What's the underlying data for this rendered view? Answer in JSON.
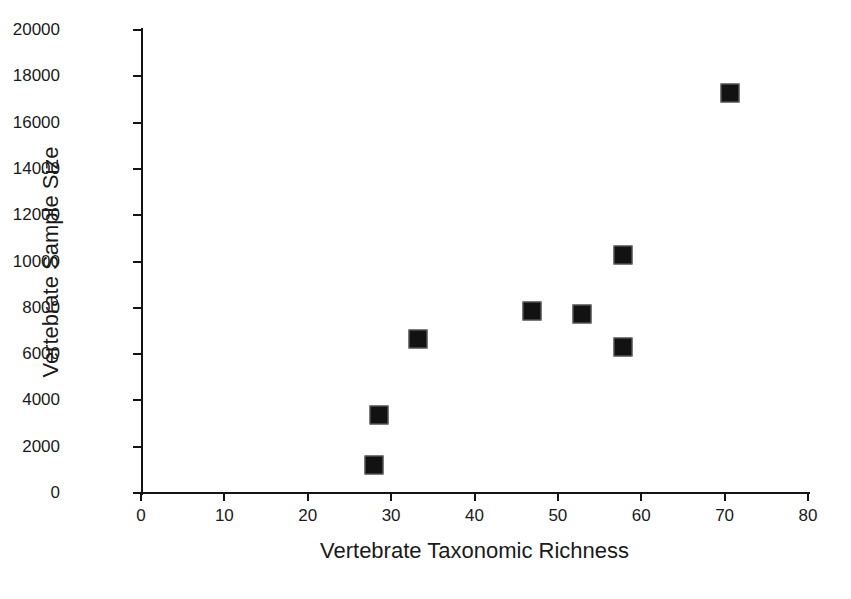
{
  "chart_data": {
    "type": "scatter",
    "title": "",
    "xlabel": "Vertebrate Taxonomic Richness",
    "ylabel": "Vertebrate Sample Size",
    "xlim": [
      0,
      80
    ],
    "ylim": [
      0,
      20000
    ],
    "xticks": [
      0,
      10,
      20,
      30,
      40,
      50,
      60,
      70,
      80
    ],
    "xtick_labels": [
      "0",
      "10",
      "20",
      "30",
      "40",
      "50",
      "60",
      "70",
      "80"
    ],
    "yticks": [
      0,
      2000,
      4000,
      6000,
      8000,
      10000,
      12000,
      14000,
      16000,
      18000,
      20000
    ],
    "ytick_labels": [
      "0",
      "2000",
      "4000",
      "6000",
      "8000",
      "10000",
      "12000",
      "14000",
      "16000",
      "18000",
      "20000"
    ],
    "grid": false,
    "legend": false,
    "marker": "filled-square",
    "marker_color": "#121212",
    "points": [
      {
        "x": 27.9,
        "y": 1210
      },
      {
        "x": 28.5,
        "y": 3370
      },
      {
        "x": 33.2,
        "y": 6650
      },
      {
        "x": 46.9,
        "y": 7860
      },
      {
        "x": 52.9,
        "y": 7730
      },
      {
        "x": 57.8,
        "y": 10280
      },
      {
        "x": 57.8,
        "y": 6310
      },
      {
        "x": 70.7,
        "y": 17280
      }
    ]
  },
  "figure": {
    "background_color": "#ffffff",
    "axis_color": "#141414",
    "text_color": "#1a1a1a"
  }
}
